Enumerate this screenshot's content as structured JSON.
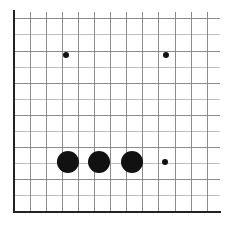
{
  "figure": {
    "width": 241,
    "height": 229,
    "background": "#ffffff"
  },
  "chart_data": {
    "type": "scatter",
    "title": "",
    "subtitle": "",
    "xlabel": "",
    "ylabel": "",
    "grid": true,
    "legend": null,
    "legend_position": "none",
    "annotations": [],
    "xtick_labels": [],
    "ytick_labels": [],
    "xlim": [
      0,
      13
    ],
    "ylim": [
      0,
      12
    ],
    "marker_color": "#111111",
    "size_units": "radius_px",
    "points": [
      {
        "label": "large-dot-1",
        "x": 3.35,
        "y": 3.1,
        "size": 11
      },
      {
        "label": "large-dot-2",
        "x": 5.28,
        "y": 3.1,
        "size": 11
      },
      {
        "label": "large-dot-3",
        "x": 7.33,
        "y": 3.1,
        "size": 11
      },
      {
        "label": "small-dot-1",
        "x": 9.38,
        "y": 3.1,
        "size": 3
      },
      {
        "label": "small-dot-2",
        "x": 3.23,
        "y": 9.75,
        "size": 3
      },
      {
        "label": "small-dot-3",
        "x": 9.44,
        "y": 9.75,
        "size": 3
      }
    ],
    "series": [
      {
        "name": "bubbles",
        "x": [
          3.35,
          5.28,
          7.33,
          9.38,
          3.23,
          9.44
        ],
        "y": [
          3.1,
          3.1,
          3.1,
          3.1,
          9.75,
          9.75
        ],
        "sizes": [
          11,
          11,
          11,
          3,
          3,
          3
        ]
      }
    ]
  },
  "axes": {
    "plot_left": 14,
    "plot_right": 220,
    "plot_top": 12,
    "plot_bottom": 212,
    "grid_step_x": 16.1,
    "grid_step_y": 16.1,
    "grid_color": "#808080",
    "grid_minor_color": "#b8b8b8",
    "axis_color": "#222222",
    "axis_width": 2.4,
    "grid_width": 0.9,
    "n_cols": 13,
    "n_rows": 12
  },
  "markers": {
    "large_radius": 11,
    "small_radius": 3,
    "fill": "#111111"
  }
}
